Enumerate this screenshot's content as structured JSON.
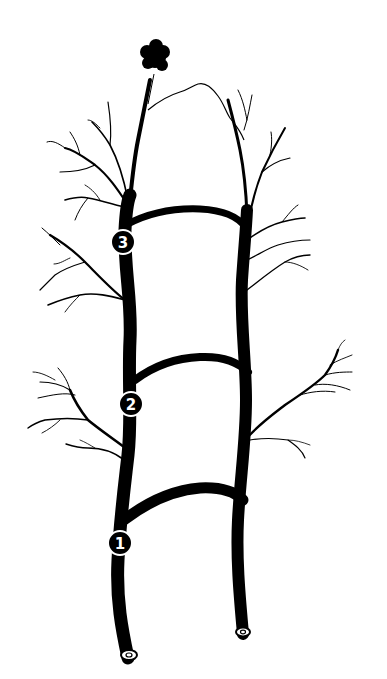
{
  "diagram": {
    "colors": {
      "ink": "#000000",
      "background": "#ffffff",
      "marker_text": "#ffffff"
    },
    "markers": [
      {
        "label": "1",
        "cx": 120,
        "cy": 543
      },
      {
        "label": "2",
        "cx": 131,
        "cy": 404
      },
      {
        "label": "3",
        "cx": 123,
        "cy": 242
      }
    ],
    "top_cluster": {
      "name": "dark-cluster",
      "cx": 155,
      "cy": 58
    }
  }
}
